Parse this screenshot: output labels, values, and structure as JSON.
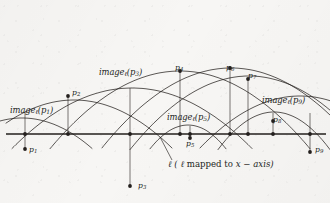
{
  "figure": {
    "type": "geometric-diagram",
    "background_color": "#f7f6f4",
    "ink_color": "#231f1d",
    "width": 330,
    "height": 203,
    "axis": {
      "name": "x-axis",
      "y": 134,
      "x_start": 6,
      "x_end": 326,
      "caption_prefix": "ℓ",
      "caption_open": "(",
      "caption_ell": "ℓ",
      "caption_text": " mapped to ",
      "caption_var": "x − axis",
      "caption_close": ")",
      "caption_full": "ℓ ( ℓ mapped to x − axis )"
    },
    "image_labels": [
      {
        "id": "image-l-p1",
        "prefix": "image",
        "ell": "ℓ",
        "arg": "(p",
        "sub": "1",
        "close": ")",
        "text": "imageℓ(p1)",
        "x": 10,
        "y": 106
      },
      {
        "id": "image-l-p3",
        "prefix": "image",
        "ell": "ℓ",
        "arg": "(p",
        "sub": "3",
        "close": ")",
        "text": "imageℓ(p3)",
        "x": 99,
        "y": 68
      },
      {
        "id": "image-l-p5",
        "prefix": "image",
        "ell": "ℓ",
        "arg": "(p",
        "sub": "5",
        "close": ")",
        "text": "imageℓ(p5)",
        "x": 167,
        "y": 113
      },
      {
        "id": "image-l-p9",
        "prefix": "image",
        "ell": "ℓ",
        "arg": "(p",
        "sub": "9",
        "close": ")",
        "text": "imageℓ(p9)",
        "x": 262,
        "y": 96
      }
    ],
    "point_labels": [
      {
        "id": "p1",
        "letter": "p",
        "sub": "1",
        "text": "p1",
        "x": 29,
        "y": 146
      },
      {
        "id": "p2",
        "letter": "p",
        "sub": "2",
        "text": "p2",
        "x": 72,
        "y": 89
      },
      {
        "id": "p3",
        "letter": "p",
        "sub": "3",
        "text": "p3",
        "x": 138,
        "y": 182
      },
      {
        "id": "p4",
        "letter": "p",
        "sub": "4",
        "text": "p4",
        "x": 175,
        "y": 64
      },
      {
        "id": "p5",
        "letter": "p",
        "sub": "5",
        "text": "p5",
        "x": 186,
        "y": 140
      },
      {
        "id": "p6",
        "letter": "p",
        "sub": "6",
        "text": "p6",
        "x": 226,
        "y": 64
      },
      {
        "id": "p7",
        "letter": "p",
        "sub": "7",
        "text": "p7",
        "x": 248,
        "y": 72
      },
      {
        "id": "p8",
        "letter": "p",
        "sub": "8",
        "text": "p8",
        "x": 273,
        "y": 116
      },
      {
        "id": "p9",
        "letter": "p",
        "sub": "9",
        "text": "p9",
        "x": 315,
        "y": 146
      }
    ]
  },
  "chart_data": {
    "type": "scatter",
    "title": "",
    "xlabel": "ℓ ( ℓ mapped to x − axis )",
    "ylabel": "",
    "grid": false,
    "legend": "none",
    "axis_y_pixel": 134,
    "parabolas": [
      {
        "name": "image_l(p1)",
        "vertex_x": 22,
        "vertex_y": 118,
        "a": 0.0062,
        "x_from": -30,
        "x_to": 120
      },
      {
        "name": "image_l(p2)",
        "vertex_x": 74,
        "vertex_y": 100,
        "a": 0.005,
        "x_from": 6,
        "x_to": 200
      },
      {
        "name": "image_l(p3)",
        "vertex_x": 132,
        "vertex_y": 88,
        "a": 0.0042,
        "x_from": 6,
        "x_to": 260
      },
      {
        "name": "image_l(p4)",
        "vertex_x": 180,
        "vertex_y": 71,
        "a": 0.0046,
        "x_from": 40,
        "x_to": 330
      },
      {
        "name": "image_l(p5)",
        "vertex_x": 188,
        "vertex_y": 125,
        "a": 0.0165,
        "x_from": 120,
        "x_to": 262
      },
      {
        "name": "image_l(p6)",
        "vertex_x": 231,
        "vertex_y": 68,
        "a": 0.0048,
        "x_from": 96,
        "x_to": 330
      },
      {
        "name": "image_l(p7)",
        "vertex_x": 249,
        "vertex_y": 76,
        "a": 0.0052,
        "x_from": 118,
        "x_to": 330
      },
      {
        "name": "image_l(p8)",
        "vertex_x": 274,
        "vertex_y": 112,
        "a": 0.012,
        "x_from": 214,
        "x_to": 330
      },
      {
        "name": "image_l(p9)",
        "vertex_x": 300,
        "vertex_y": 96,
        "a": 0.0052,
        "x_from": 176,
        "x_to": 330
      }
    ],
    "axis_points": [
      {
        "name": "p1-foot",
        "x": 25,
        "y": 134
      },
      {
        "name": "p2-foot",
        "x": 68,
        "y": 134
      },
      {
        "name": "p3-foot",
        "x": 130,
        "y": 134
      },
      {
        "name": "p4-foot",
        "x": 180,
        "y": 134
      },
      {
        "name": "p5-foot",
        "x": 190,
        "y": 134
      },
      {
        "name": "p6-foot",
        "x": 230,
        "y": 134
      },
      {
        "name": "p7-foot",
        "x": 248,
        "y": 134
      },
      {
        "name": "p8-foot",
        "x": 273,
        "y": 134
      },
      {
        "name": "p9-foot",
        "x": 310,
        "y": 134
      }
    ],
    "marked_points": [
      {
        "name": "p1",
        "x": 25,
        "y": 149
      },
      {
        "name": "p2",
        "x": 68,
        "y": 96
      },
      {
        "name": "p3",
        "x": 130,
        "y": 186
      },
      {
        "name": "p4",
        "x": 180,
        "y": 71
      },
      {
        "name": "p5",
        "x": 190,
        "y": 138
      },
      {
        "name": "p6",
        "x": 230,
        "y": 68
      },
      {
        "name": "p7",
        "x": 248,
        "y": 79
      },
      {
        "name": "p8",
        "x": 273,
        "y": 121
      },
      {
        "name": "p9",
        "x": 310,
        "y": 152
      }
    ],
    "connectors": [
      {
        "name": "p1-connector",
        "x": 25,
        "y1": 112,
        "y2": 149
      },
      {
        "name": "p2-connector",
        "x": 68,
        "y1": 96,
        "y2": 134
      },
      {
        "name": "p3-connector",
        "x": 130,
        "y1": 88,
        "y2": 186
      },
      {
        "name": "p4-connector",
        "x": 180,
        "y1": 71,
        "y2": 134
      },
      {
        "name": "p5-connector",
        "x": 190,
        "y1": 126,
        "y2": 138
      },
      {
        "name": "p6-connector",
        "x": 230,
        "y1": 68,
        "y2": 134
      },
      {
        "name": "p7-connector",
        "x": 248,
        "y1": 79,
        "y2": 134
      },
      {
        "name": "p8-connector",
        "x": 273,
        "y1": 113,
        "y2": 134
      },
      {
        "name": "p9-connector",
        "x": 310,
        "y1": 113,
        "y2": 152
      }
    ],
    "leader_line": {
      "name": "axis-caption-leader",
      "x1": 160,
      "y1": 137,
      "x2": 172,
      "y2": 160
    }
  }
}
